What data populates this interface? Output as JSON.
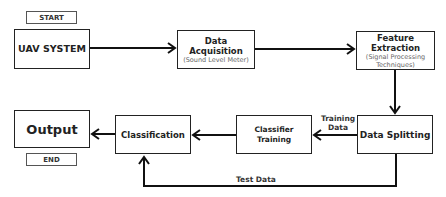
{
  "nodes": {
    "start": {
      "label": "START"
    },
    "uav": {
      "label": "UAV SYSTEM"
    },
    "acquisition": {
      "label": "Data Acquisition",
      "sub": "(Sound Level Meter)"
    },
    "feature": {
      "label": "Feature Extraction",
      "sub1": "(Signal Processing",
      "sub2": "Techniques)"
    },
    "splitting": {
      "label": "Data Splitting"
    },
    "training": {
      "label": "Classifier Training"
    },
    "classification": {
      "label": "Classification"
    },
    "output": {
      "label": "Output"
    },
    "end": {
      "label": "END"
    }
  },
  "edges": {
    "training_data_1": "Training",
    "training_data_2": "Data",
    "test_data": "Test Data"
  }
}
